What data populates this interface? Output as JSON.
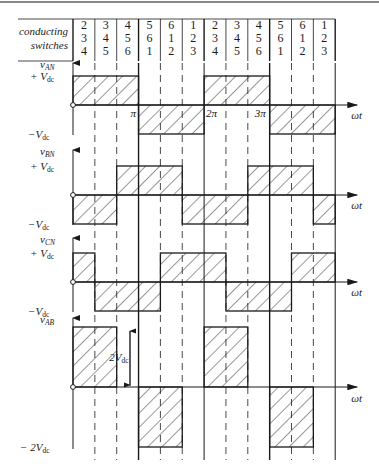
{
  "figure": {
    "top_rule_color": "#888888",
    "ink_color": "#1a1a1a",
    "header": {
      "row_label_line1": "conducting",
      "row_label_line2": "switches",
      "columns": [
        [
          "2",
          "3",
          "4"
        ],
        [
          "3",
          "4",
          "5"
        ],
        [
          "4",
          "5",
          "6"
        ],
        [
          "5",
          "6",
          "1"
        ],
        [
          "6",
          "1",
          "2"
        ],
        [
          "1",
          "2",
          "3"
        ],
        [
          "2",
          "3",
          "4"
        ],
        [
          "3",
          "4",
          "5"
        ],
        [
          "4",
          "5",
          "6"
        ],
        [
          "5",
          "6",
          "1"
        ],
        [
          "6",
          "1",
          "2"
        ],
        [
          "1",
          "2",
          "3"
        ]
      ]
    },
    "axis_label": "ωt",
    "tick_labels": {
      "pi": "π",
      "two_pi": "2π",
      "three_pi": "3π",
      "origin": "0"
    },
    "waveforms": [
      {
        "name": "vAN",
        "label_main": "v",
        "label_sub": "AN",
        "pos_label": "+ V",
        "pos_sub": "dc",
        "neg_label": "−V",
        "neg_sub": "dc",
        "levels": [
          1,
          1,
          1,
          -1,
          -1,
          -1,
          1,
          1,
          1,
          -1,
          -1,
          -1
        ]
      },
      {
        "name": "vBN",
        "label_main": "v",
        "label_sub": "BN",
        "pos_label": "+ V",
        "pos_sub": "dc",
        "neg_label": "−V",
        "neg_sub": "dc",
        "levels": [
          -1,
          -1,
          1,
          1,
          1,
          -1,
          -1,
          -1,
          1,
          1,
          1,
          -1
        ]
      },
      {
        "name": "vCN",
        "label_main": "v",
        "label_sub": "CN",
        "pos_label": "+ V",
        "pos_sub": "dc",
        "neg_label": "−V",
        "neg_sub": "dc",
        "levels": [
          1,
          -1,
          -1,
          -1,
          1,
          1,
          1,
          -1,
          -1,
          -1,
          1,
          1
        ]
      },
      {
        "name": "vAB",
        "label_main": "v",
        "label_sub": "AB",
        "pos_label": "",
        "pos_sub": "",
        "neg_label": "− 2V",
        "neg_sub": "dc",
        "levels": [
          2,
          2,
          0,
          -2,
          -2,
          0,
          2,
          2,
          0,
          -2,
          -2,
          0
        ],
        "amplitude_annotation": "2V",
        "amplitude_annotation_sub": "dc"
      }
    ]
  }
}
